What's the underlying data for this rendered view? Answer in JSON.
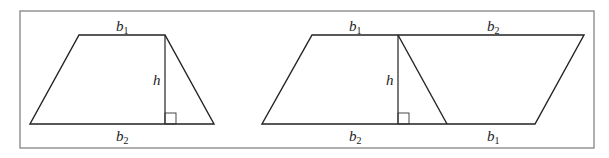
{
  "figure": {
    "width": 609,
    "height": 158,
    "colors": {
      "frame": "#7a7a7a",
      "stroke": "#222222",
      "background": "#ffffff"
    },
    "frame": {
      "x": 20,
      "y": 11,
      "w": 574,
      "h": 137
    },
    "trapezoid": {
      "points": "79,35 165,35 214,124 30,124",
      "height_line": {
        "x": 165,
        "y1": 35,
        "y2": 124
      },
      "right_angle": {
        "x": 165,
        "y": 113,
        "size": 11
      },
      "labels": {
        "top": {
          "base": "b",
          "sub": "1",
          "x": 116,
          "y": 31
        },
        "bottom": {
          "base": "b",
          "sub": "2",
          "x": 116,
          "y": 141
        },
        "height": {
          "text": "h",
          "x": 153,
          "y": 85
        }
      }
    },
    "parallelogram": {
      "points": "312,35 584,35 535,124 262,124",
      "height_line": {
        "x": 398,
        "y1": 35,
        "y2": 124
      },
      "diagonal": {
        "x1": 398,
        "y1": 35,
        "x2": 447,
        "y2": 124
      },
      "right_angle": {
        "x": 398,
        "y": 113,
        "size": 11
      },
      "labels": {
        "top_left": {
          "base": "b",
          "sub": "1",
          "x": 349,
          "y": 31
        },
        "top_right": {
          "base": "b",
          "sub": "2",
          "x": 487,
          "y": 31
        },
        "bottom_left": {
          "base": "b",
          "sub": "2",
          "x": 349,
          "y": 141
        },
        "bottom_right": {
          "base": "b",
          "sub": "1",
          "x": 487,
          "y": 141
        },
        "height": {
          "text": "h",
          "x": 386,
          "y": 85
        }
      }
    }
  }
}
